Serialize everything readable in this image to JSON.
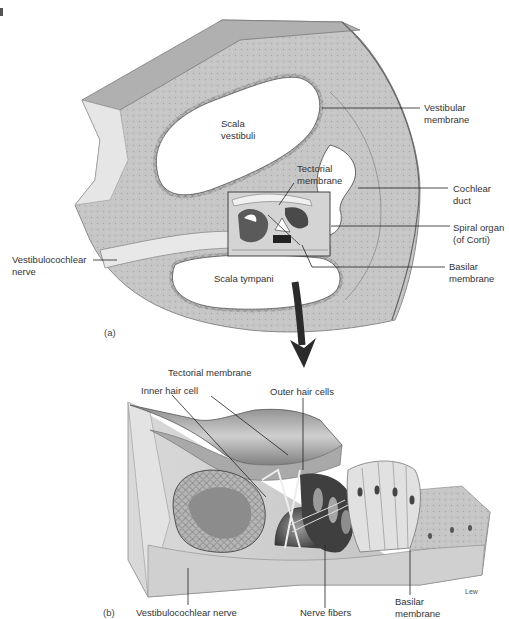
{
  "figure": {
    "credit": "Lew"
  },
  "panel_a": {
    "tag": "(a)",
    "labels": {
      "scala_vestibuli": [
        "Scala",
        "vestibuli"
      ],
      "tectorial_membrane": [
        "Tectorial",
        "membrane"
      ],
      "vestibular_membrane": [
        "Vestibular",
        "membrane"
      ],
      "cochlear_duct": [
        "Cochlear",
        "duct"
      ],
      "spiral_organ": [
        "Spiral organ",
        "(of Corti)"
      ],
      "basilar_membrane": [
        "Basilar",
        "membrane"
      ],
      "vestibulocochlear_nerve": [
        "Vestibulocochlear",
        "nerve"
      ],
      "scala_tympani": "Scala tympani"
    }
  },
  "panel_b": {
    "tag": "(b)",
    "labels": {
      "tectorial_membrane": "Tectorial membrane",
      "inner_hair_cell": "Inner hair cell",
      "outer_hair_cells": "Outer hair cells",
      "vestibulocochlear_nerve": "Vestibulocochlear nerve",
      "nerve_fibers": "Nerve fibers",
      "basilar_membrane": [
        "Basilar",
        "membrane"
      ]
    }
  },
  "colors": {
    "bone_fill": "#c9c9c9",
    "bone_dark": "#9a9a9a",
    "cavity": "#ffffff",
    "line": "#222222",
    "arrow": "#2b2b2b",
    "tissue_light": "#e4e4e4",
    "tissue_mid": "#b8b8b8",
    "tissue_dark": "#6e6e6e"
  }
}
